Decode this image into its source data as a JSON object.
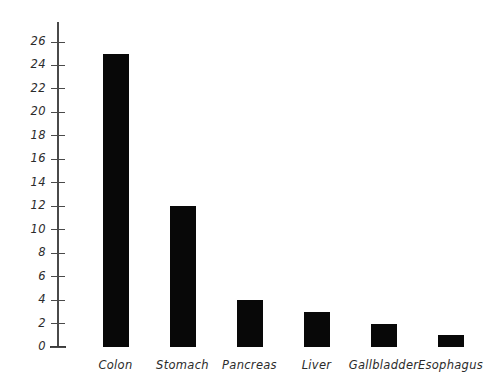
{
  "chart_data": {
    "type": "bar",
    "title": "",
    "subtitle": "",
    "xlabel": "",
    "ylabel": "",
    "categories": [
      "Colon",
      "Stomach",
      "Pancreas",
      "Liver",
      "Gallbladder",
      "Esophagus"
    ],
    "values": [
      25,
      12,
      4,
      3,
      2,
      1
    ],
    "series": [
      {
        "name": "",
        "values": [
          25,
          12,
          4,
          3,
          2,
          1
        ]
      }
    ],
    "ylim": [
      0,
      26
    ],
    "y_ticks": [
      0,
      2,
      4,
      6,
      8,
      10,
      12,
      14,
      16,
      18,
      20,
      22,
      24,
      26
    ],
    "y_tick_labels": [
      "0",
      "2",
      "4",
      "6",
      "8",
      "10",
      "12",
      "14",
      "16",
      "18",
      "20",
      "22",
      "24",
      "26"
    ],
    "grid": false,
    "legend": false,
    "legend_position": "none",
    "bar_color": "#080808",
    "axis_color": "#4a4a4a",
    "background_color": "#ffffff",
    "annotations": []
  },
  "axis": {
    "y_axis_name": "y-axis",
    "x_axis_name": "x-axis"
  }
}
